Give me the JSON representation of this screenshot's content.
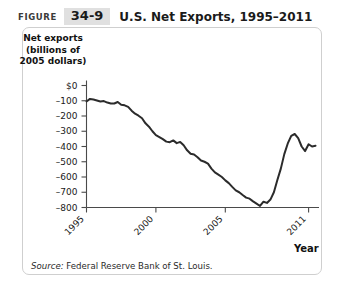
{
  "header": {
    "figure_word": "FIGURE",
    "figure_number": "34-9",
    "title": "U.S. Net Exports, 1995–2011"
  },
  "axis_titles": {
    "y_line1": "Net exports",
    "y_line2": "(billions of",
    "y_line3": "2005 dollars)",
    "x_label": "Year"
  },
  "source": {
    "label": "Source:",
    "text": " Federal Reserve Bank of St. Louis."
  },
  "colors": {
    "line": "#2b2b2b",
    "axis": "#4a4a4a",
    "panel_border": "#cfcfcf",
    "badge_bg": "#e0e0e0",
    "text": "#1a1a1a"
  },
  "chart_data": {
    "type": "line",
    "title": "U.S. Net Exports, 1995–2011",
    "xlabel": "Year",
    "ylabel": "Net exports (billions of 2005 dollars)",
    "xlim": [
      1995,
      2011.75
    ],
    "ylim": [
      -850,
      0
    ],
    "grid": false,
    "legend": null,
    "ytick_labels": [
      "$0",
      "–100",
      "–200",
      "–300",
      "–400",
      "–500",
      "–600",
      "–700",
      "–800"
    ],
    "yticks": [
      0,
      -100,
      -200,
      -300,
      -400,
      -500,
      -600,
      -700,
      -800
    ],
    "xtick_labels": [
      "1995",
      "2000",
      "2005",
      "2011"
    ],
    "xticks": [
      1995,
      2000,
      2005,
      2011
    ],
    "series": [
      {
        "name": "U.S. net exports",
        "x": [
          1995.0,
          1995.25,
          1995.5,
          1995.75,
          1996.0,
          1996.25,
          1996.5,
          1996.75,
          1997.0,
          1997.25,
          1997.5,
          1997.75,
          1998.0,
          1998.25,
          1998.5,
          1998.75,
          1999.0,
          1999.25,
          1999.5,
          1999.75,
          2000.0,
          2000.25,
          2000.5,
          2000.75,
          2001.0,
          2001.25,
          2001.5,
          2001.75,
          2002.0,
          2002.25,
          2002.5,
          2002.75,
          2003.0,
          2003.25,
          2003.5,
          2003.75,
          2004.0,
          2004.25,
          2004.5,
          2004.75,
          2005.0,
          2005.25,
          2005.5,
          2005.75,
          2006.0,
          2006.25,
          2006.5,
          2006.75,
          2007.0,
          2007.25,
          2007.5,
          2007.75,
          2008.0,
          2008.25,
          2008.5,
          2008.75,
          2009.0,
          2009.25,
          2009.5,
          2009.75,
          2010.0,
          2010.25,
          2010.5,
          2010.75,
          2011.0,
          2011.25,
          2011.5
        ],
        "values": [
          -105,
          -88,
          -92,
          -98,
          -105,
          -102,
          -112,
          -118,
          -118,
          -108,
          -126,
          -130,
          -140,
          -165,
          -185,
          -198,
          -215,
          -248,
          -270,
          -300,
          -325,
          -338,
          -352,
          -368,
          -372,
          -360,
          -378,
          -370,
          -392,
          -425,
          -448,
          -452,
          -470,
          -492,
          -500,
          -512,
          -545,
          -570,
          -585,
          -600,
          -622,
          -640,
          -665,
          -688,
          -700,
          -718,
          -735,
          -742,
          -760,
          -775,
          -790,
          -762,
          -770,
          -748,
          -700,
          -620,
          -545,
          -450,
          -380,
          -330,
          -318,
          -345,
          -400,
          -430,
          -385,
          -400,
          -395
        ]
      }
    ]
  }
}
